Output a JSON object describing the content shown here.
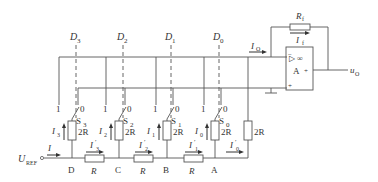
{
  "diagram": {
    "title": "",
    "type": "R-2R ladder DAC (inverted ladder) circuit",
    "colors": {
      "line": "#555555",
      "text": "#333333",
      "background": "#ffffff"
    },
    "digital_inputs": [
      "D3",
      "D2",
      "D1",
      "D0"
    ],
    "digital_input_labels": {
      "d3": {
        "main": "D",
        "sub": "3"
      },
      "d2": {
        "main": "D",
        "sub": "2"
      },
      "d1": {
        "main": "D",
        "sub": "1"
      },
      "d0": {
        "main": "D",
        "sub": "0"
      }
    },
    "switches": {
      "s3": {
        "main": "S",
        "sub": "3",
        "pos1": "1",
        "pos0": "0"
      },
      "s2": {
        "main": "S",
        "sub": "2",
        "pos1": "1",
        "pos0": "0"
      },
      "s1": {
        "main": "S",
        "sub": "1",
        "pos1": "1",
        "pos0": "0"
      },
      "s0": {
        "main": "S",
        "sub": "0",
        "pos1": "1",
        "pos0": "0"
      }
    },
    "branch_resistors": {
      "r3": "2R",
      "r2": "2R",
      "r1": "2R",
      "r0": "2R",
      "terminal": "2R"
    },
    "series_resistors": {
      "dc": "R",
      "cb": "R",
      "ba": "R"
    },
    "nodes": {
      "d": "D",
      "c": "C",
      "b": "B",
      "a": "A"
    },
    "currents": {
      "i": "I",
      "i3": {
        "main": "I",
        "sub": "3"
      },
      "i2": {
        "main": "I",
        "sub": "2"
      },
      "i1": {
        "main": "I",
        "sub": "1"
      },
      "i0": {
        "main": "I",
        "sub": "0"
      },
      "i3p": {
        "main": "I",
        "sub": "3",
        "prime": "′"
      },
      "i2p": {
        "main": "I",
        "sub": "2",
        "prime": "′"
      },
      "i1p": {
        "main": "I",
        "sub": "1",
        "prime": "′"
      },
      "i0p": {
        "main": "I",
        "sub": "0",
        "prime": "′"
      },
      "io": {
        "main": "I",
        "sub": "O"
      },
      "if": {
        "main": "I",
        "sub": "f"
      }
    },
    "reference": {
      "main": "U",
      "sub": "REF"
    },
    "op_amp": {
      "label": "A",
      "symbol": "▷ ∞",
      "inverting": "−",
      "noninverting": "+",
      "output_sign": "+"
    },
    "feedback_resistor": {
      "main": "R",
      "sub": "f"
    },
    "output": {
      "main": "u",
      "sub": "O"
    }
  }
}
